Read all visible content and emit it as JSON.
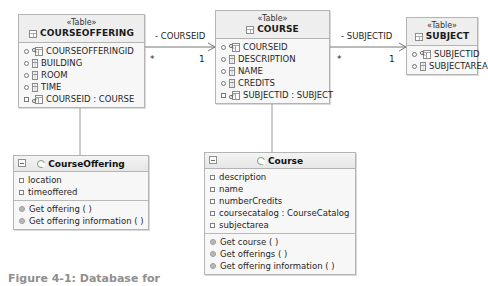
{
  "diagram": {
    "type": "uml-class-diagram",
    "caption": "Figure 4-1: Database for",
    "tables": [
      {
        "id": "courseoffering",
        "stereotype": "«Table»",
        "name": "COURSEOFFERING",
        "header_icon": "table-icon",
        "columns": [
          {
            "visibility": "public",
            "icon": "primary-key-icon",
            "label": "COURSEOFFERINGID"
          },
          {
            "visibility": "public",
            "icon": "column-icon",
            "label": "BUILDING"
          },
          {
            "visibility": "public",
            "icon": "column-icon",
            "label": "ROOM"
          },
          {
            "visibility": "public",
            "icon": "column-icon",
            "label": "TIME"
          },
          {
            "visibility": "protected",
            "icon": "foreign-key-icon",
            "label": "COURSEID : COURSE"
          }
        ]
      },
      {
        "id": "course",
        "stereotype": "«Table»",
        "name": "COURSE",
        "header_icon": "table-icon",
        "columns": [
          {
            "visibility": "public",
            "icon": "primary-key-icon",
            "label": "COURSEID"
          },
          {
            "visibility": "public",
            "icon": "column-icon",
            "label": "DESCRIPTION"
          },
          {
            "visibility": "public",
            "icon": "column-icon",
            "label": "NAME"
          },
          {
            "visibility": "public",
            "icon": "column-icon",
            "label": "CREDITS"
          },
          {
            "visibility": "protected",
            "icon": "foreign-key-icon",
            "label": "SUBJECTID : SUBJECT"
          }
        ]
      },
      {
        "id": "subject",
        "stereotype": "«Table»",
        "name": "SUBJECT",
        "header_icon": "table-icon",
        "columns": [
          {
            "visibility": "public",
            "icon": "primary-key-icon",
            "label": "SUBJECTID"
          },
          {
            "visibility": "public",
            "icon": "column-icon",
            "label": "SUBJECTAREA"
          }
        ]
      }
    ],
    "classes": [
      {
        "id": "courseoffering-class",
        "name": "CourseOffering",
        "attributes": [
          {
            "label": "location"
          },
          {
            "label": "timeoffered"
          }
        ],
        "operations": [
          {
            "label": "Get offering ( )"
          },
          {
            "label": "Get offering information ( )"
          }
        ]
      },
      {
        "id": "course-class",
        "name": "Course",
        "attributes": [
          {
            "label": "description"
          },
          {
            "label": "name"
          },
          {
            "label": "numberCredits"
          },
          {
            "label": "coursecatalog : CourseCatalog"
          },
          {
            "label": "subjectarea"
          }
        ],
        "operations": [
          {
            "label": "Get course ( )"
          },
          {
            "label": "Get offerings ( )"
          },
          {
            "label": "Get offering information ( )"
          }
        ]
      }
    ],
    "associations": [
      {
        "id": "courseoffering-course",
        "label": "- COURSEID",
        "source_multiplicity": "*",
        "target_multiplicity": "1"
      },
      {
        "id": "course-subject",
        "label": "- SUBJECTID",
        "source_multiplicity": "*",
        "target_multiplicity": "1"
      }
    ]
  }
}
